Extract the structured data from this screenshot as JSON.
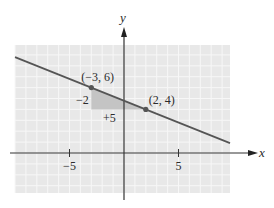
{
  "chart_data": {
    "type": "line",
    "title": "",
    "xlabel": "x",
    "ylabel": "y",
    "xlim": [
      -10,
      10
    ],
    "ylim": [
      -4,
      10
    ],
    "x_ticks": [
      -5,
      5
    ],
    "x_tick_labels": [
      "−5",
      "5"
    ],
    "grid": true,
    "line": {
      "equation": "y = -2/5 x + 24/5",
      "slope": -0.4,
      "x_range": [
        -10,
        10
      ]
    },
    "points": [
      {
        "x": -3,
        "y": 6,
        "label": "(−3, 6)"
      },
      {
        "x": 2,
        "y": 4,
        "label": "(2, 4)"
      }
    ],
    "slope_triangle": {
      "rise_label": "−2",
      "run_label": "+5",
      "from": [
        -3,
        6
      ],
      "to": [
        2,
        4
      ]
    },
    "colors": {
      "grid_bg": "#e8e8e8",
      "grid_line": "#f7f7f7",
      "shade": "#c4c4c4",
      "line": "#555555",
      "axis": "#333333"
    }
  }
}
